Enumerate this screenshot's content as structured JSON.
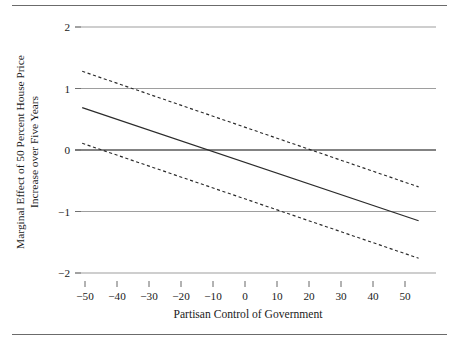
{
  "figure": {
    "background_color": "#ffffff",
    "ink_color": "#2b2b2b",
    "grid_color": "#8d8d8d",
    "rule_color": "#6b6b6b",
    "top_rule": true,
    "bottom_rule": true
  },
  "chart_data": {
    "type": "line",
    "title": "",
    "subtitle": "",
    "xlabel": "Partisan Control of Government",
    "ylabel": "Marginal Effect of 50 Percent House Price Increase over Five Years",
    "ylabel_lines": [
      "Marginal Effect of 50 Percent House Price",
      "Increase over Five Years"
    ],
    "xlim": [
      -53,
      53
    ],
    "ylim": [
      -2,
      2
    ],
    "xticks": [
      -50,
      -40,
      -30,
      -20,
      -10,
      0,
      10,
      20,
      30,
      40,
      50
    ],
    "xticklabels": [
      "−50",
      "−40",
      "−30",
      "−20",
      "−10",
      "0",
      "10",
      "20",
      "30",
      "40",
      "50"
    ],
    "yticks": [
      -2,
      -1,
      0,
      1,
      2
    ],
    "yticklabels": [
      "−2",
      "−1",
      "0",
      "1",
      "2"
    ],
    "grid": true,
    "grid_axis": "y",
    "legend": false,
    "legend_position": "none",
    "zero_reference_line": 0,
    "x_domain_data": [
      -51,
      48
    ],
    "series": [
      {
        "name": "Marginal effect (point estimate)",
        "style": "solid",
        "x": [
          -51,
          48
        ],
        "values": [
          0.69,
          -1.15
        ]
      },
      {
        "name": "Upper 95% confidence bound",
        "style": "dashed",
        "x": [
          -51,
          48
        ],
        "values": [
          1.28,
          -0.6
        ]
      },
      {
        "name": "Lower 95% confidence bound",
        "style": "dashed",
        "x": [
          -51,
          48
        ],
        "values": [
          0.11,
          -1.76
        ]
      }
    ],
    "annotations": [
      {
        "label": "point estimate crosses zero",
        "x": -14,
        "y": 0
      }
    ]
  }
}
